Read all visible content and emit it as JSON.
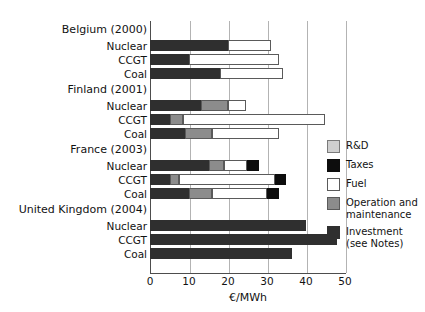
{
  "chart_data": {
    "type": "bar",
    "orientation": "horizontal",
    "stacked": true,
    "title": "",
    "xlabel": "€/MWh",
    "ylabel": "",
    "xlim": [
      0,
      50
    ],
    "xticks": [
      0,
      10,
      20,
      30,
      40,
      50
    ],
    "grid": true,
    "legend_position": "right",
    "series": [
      {
        "name": "R&D",
        "color": "#cfcfcf"
      },
      {
        "name": "Taxes",
        "color": "#0d0d0d"
      },
      {
        "name": "Fuel",
        "color": "#ffffff"
      },
      {
        "name": "Operation and maintenance",
        "color": "#8c8c8c"
      },
      {
        "name": "Investment (see Notes)",
        "color": "#2f2f2f"
      }
    ],
    "groups": [
      {
        "label": "Belgium (2000)",
        "categories": [
          "Nuclear",
          "CCGT",
          "Coal"
        ],
        "bars": [
          {
            "category": "Nuclear",
            "segments": [
              {
                "series": "Investment (see Notes)",
                "value": 20.0
              },
              {
                "series": "Fuel",
                "value": 11.0
              }
            ],
            "total": 31.0
          },
          {
            "category": "CCGT",
            "segments": [
              {
                "series": "Investment (see Notes)",
                "value": 10.0
              },
              {
                "series": "Fuel",
                "value": 23.0
              }
            ],
            "total": 33.0
          },
          {
            "category": "Coal",
            "segments": [
              {
                "series": "Investment (see Notes)",
                "value": 18.0
              },
              {
                "series": "Fuel",
                "value": 16.0
              }
            ],
            "total": 34.0
          }
        ]
      },
      {
        "label": "Finland (2001)",
        "categories": [
          "Nuclear",
          "CCGT",
          "Coal"
        ],
        "bars": [
          {
            "category": "Nuclear",
            "segments": [
              {
                "series": "Investment (see Notes)",
                "value": 13.0
              },
              {
                "series": "Operation and maintenance",
                "value": 7.0
              },
              {
                "series": "Fuel",
                "value": 4.5
              }
            ],
            "total": 24.5
          },
          {
            "category": "CCGT",
            "segments": [
              {
                "series": "Investment (see Notes)",
                "value": 5.0
              },
              {
                "series": "Operation and maintenance",
                "value": 3.5
              },
              {
                "series": "Fuel",
                "value": 36.5
              }
            ],
            "total": 45.0
          },
          {
            "category": "Coal",
            "segments": [
              {
                "series": "Investment (see Notes)",
                "value": 9.0
              },
              {
                "series": "Operation and maintenance",
                "value": 7.0
              },
              {
                "series": "Fuel",
                "value": 17.0
              }
            ],
            "total": 33.0
          }
        ]
      },
      {
        "label": "France (2003)",
        "categories": [
          "Nuclear",
          "CCGT",
          "Coal"
        ],
        "bars": [
          {
            "category": "Nuclear",
            "segments": [
              {
                "series": "Investment (see Notes)",
                "value": 15.0
              },
              {
                "series": "Operation and maintenance",
                "value": 4.0
              },
              {
                "series": "Fuel",
                "value": 6.0
              },
              {
                "series": "Taxes",
                "value": 3.0
              }
            ],
            "total": 28.0
          },
          {
            "category": "CCGT",
            "segments": [
              {
                "series": "Investment (see Notes)",
                "value": 5.0
              },
              {
                "series": "Operation and maintenance",
                "value": 2.5
              },
              {
                "series": "Fuel",
                "value": 24.5
              },
              {
                "series": "Taxes",
                "value": 3.0
              }
            ],
            "total": 35.0
          },
          {
            "category": "Coal",
            "segments": [
              {
                "series": "Investment (see Notes)",
                "value": 10.0
              },
              {
                "series": "Operation and maintenance",
                "value": 6.0
              },
              {
                "series": "Fuel",
                "value": 14.0
              },
              {
                "series": "Taxes",
                "value": 3.0
              }
            ],
            "total": 33.0
          }
        ]
      },
      {
        "label": "United Kingdom (2004)",
        "categories": [
          "Nuclear",
          "CCGT",
          "Coal"
        ],
        "bars": [
          {
            "category": "Nuclear",
            "segments": [
              {
                "series": "Investment (see Notes)",
                "value": 40.0
              }
            ],
            "total": 40.0
          },
          {
            "category": "CCGT",
            "segments": [
              {
                "series": "Investment (see Notes)",
                "value": 48.0
              }
            ],
            "total": 48.0
          },
          {
            "category": "Coal",
            "segments": [
              {
                "series": "Investment (see Notes)",
                "value": 36.5
              }
            ],
            "total": 36.5
          }
        ]
      }
    ]
  },
  "legend": {
    "items": [
      {
        "label": "R&D",
        "color": "#cfcfcf",
        "swatch_class": "seg-rd"
      },
      {
        "label": "Taxes",
        "color": "#0d0d0d",
        "swatch_class": "seg-taxes"
      },
      {
        "label": "Fuel",
        "color": "#ffffff",
        "swatch_class": "seg-fuel"
      },
      {
        "label": "Operation and\nmaintenance",
        "color": "#8c8c8c",
        "swatch_class": "seg-om"
      },
      {
        "label": "Investment\n(see Notes)",
        "color": "#2f2f2f",
        "swatch_class": "seg-investment"
      }
    ]
  },
  "axis": {
    "x_title": "€/MWh",
    "x_tick_labels": [
      "0",
      "10",
      "20",
      "30",
      "40",
      "50"
    ]
  }
}
